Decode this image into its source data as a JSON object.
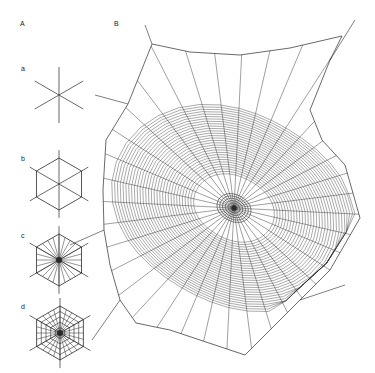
{
  "figure": {
    "panel_labels": {
      "A": "A",
      "B": "B",
      "a": "a",
      "b": "b",
      "c": "c",
      "d": "d"
    },
    "colors": {
      "background": "#ffffff",
      "thread": "#2a2a2a",
      "label": "#222222"
    },
    "stages": [
      {
        "id": "a",
        "description": "radii only",
        "cx": 59,
        "cy": 95,
        "r": 28,
        "radii": 6,
        "frame": false,
        "hub_density": 0,
        "spiral_rings": 0
      },
      {
        "id": "b",
        "description": "radii with hexagonal frame",
        "cx": 59,
        "cy": 184,
        "r": 26,
        "radii": 6,
        "frame": true,
        "hub_density": 0,
        "spiral_rings": 0
      },
      {
        "id": "c",
        "description": "frame with many radii",
        "cx": 59,
        "cy": 260,
        "r": 26,
        "radii": 24,
        "frame": true,
        "hub_density": 1,
        "spiral_rings": 0
      },
      {
        "id": "d",
        "description": "frame, radii and auxiliary spiral",
        "cx": 60,
        "cy": 333,
        "r": 27,
        "radii": 24,
        "frame": true,
        "hub_density": 1,
        "spiral_rings": 4
      }
    ],
    "web": {
      "hub": {
        "cx": 234,
        "cy": 208
      },
      "frame": [
        [
          152,
          44
        ],
        [
          190,
          52
        ],
        [
          240,
          55
        ],
        [
          290,
          48
        ],
        [
          342,
          36
        ],
        [
          330,
          60
        ],
        [
          310,
          110
        ],
        [
          322,
          140
        ],
        [
          345,
          165
        ],
        [
          360,
          218
        ],
        [
          330,
          270
        ],
        [
          300,
          300
        ],
        [
          245,
          355
        ],
        [
          215,
          345
        ],
        [
          170,
          330
        ],
        [
          136,
          323
        ],
        [
          120,
          300
        ],
        [
          110,
          265
        ],
        [
          104,
          230
        ],
        [
          103,
          190
        ],
        [
          106,
          140
        ],
        [
          128,
          104
        ],
        [
          152,
          44
        ]
      ],
      "radii_count": 36,
      "capture_spiral": {
        "inner_r": 38,
        "outer_r": 115,
        "rings": 30
      },
      "hub_spiral": {
        "inner_r": 3,
        "outer_r": 16,
        "rings": 6
      }
    }
  }
}
